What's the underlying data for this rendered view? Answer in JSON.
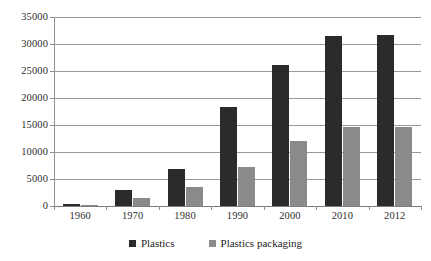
{
  "chart_data": {
    "type": "bar",
    "title": "",
    "subtitle": "",
    "xlabel": "",
    "ylabel": "",
    "categories": [
      "1960",
      "1970",
      "1980",
      "1990",
      "2000",
      "2010",
      "2012"
    ],
    "series": [
      {
        "name": "Plastics",
        "color": "#2b2b2b",
        "values": [
          390,
          2900,
          6800,
          18300,
          26200,
          31400,
          31600
        ]
      },
      {
        "name": "Plastics packaging",
        "color": "#8a8a8a",
        "values": [
          120,
          1400,
          3600,
          7300,
          12100,
          14700,
          14700
        ]
      }
    ],
    "ylim": [
      0,
      35000
    ],
    "ytick_values": [
      0,
      5000,
      10000,
      15000,
      20000,
      25000,
      30000,
      35000
    ],
    "ytick_labels": [
      "0",
      "5000",
      "10000",
      "15000",
      "20000",
      "25000",
      "30000",
      "35000"
    ],
    "grid": true,
    "grid_axis": "y",
    "legend_position": "bottom",
    "legend_entries": [
      "Plastics",
      "Plastics packaging"
    ],
    "annotations": []
  },
  "colors": {
    "background": "#ffffff",
    "gridline": "#9a9a9a",
    "axis": "#8f8f8f",
    "text": "#2e2e2e",
    "series_plastics": "#2b2b2b",
    "series_packaging": "#8a8a8a"
  }
}
